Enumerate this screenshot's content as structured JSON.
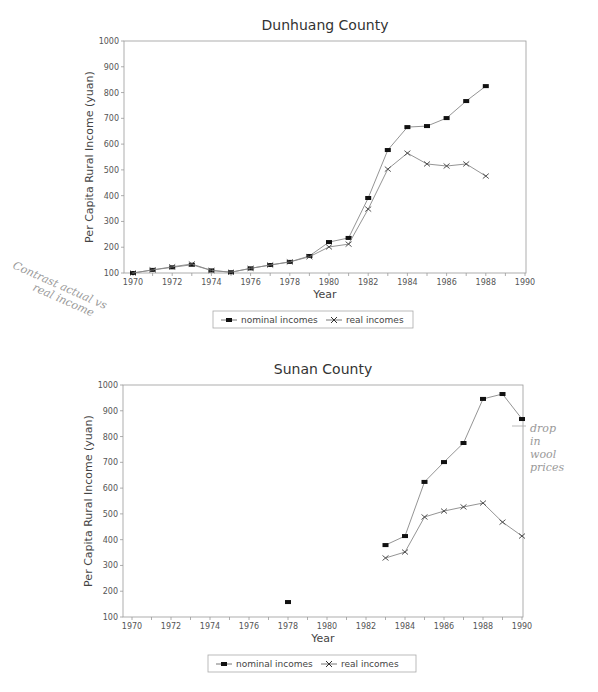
{
  "chart_data": [
    {
      "type": "line",
      "title": "Dunhuang County",
      "xlabel": "Year",
      "ylabel": "Per Capita Rural Income (yuan)",
      "xlim": [
        1970,
        1990
      ],
      "ylim": [
        100,
        1000
      ],
      "x_ticks": [
        "1970",
        "1972",
        "1974",
        "1976",
        "1978",
        "1980",
        "1982",
        "1984",
        "1986",
        "1988",
        "1990"
      ],
      "y_ticks": [
        "100",
        "200",
        "300",
        "400",
        "500",
        "600",
        "700",
        "800",
        "900",
        "1000"
      ],
      "grid": false,
      "legend_position": "bottom",
      "x": [
        1970,
        1971,
        1972,
        1973,
        1974,
        1975,
        1976,
        1977,
        1978,
        1979,
        1980,
        1981,
        1982,
        1983,
        1984,
        1985,
        1986,
        1987,
        1988
      ],
      "series": [
        {
          "name": "nominal incomes",
          "marker": "square",
          "values": [
            100,
            112,
            122,
            132,
            110,
            103,
            118,
            131,
            143,
            166,
            220,
            236,
            391,
            577,
            666,
            670,
            701,
            767,
            825
          ]
        },
        {
          "name": "real incomes",
          "marker": "x",
          "values": [
            100,
            112,
            124,
            135,
            110,
            103,
            118,
            131,
            143,
            163,
            201,
            212,
            348,
            503,
            565,
            523,
            515,
            523,
            476
          ]
        }
      ]
    },
    {
      "type": "line",
      "title": "Sunan County",
      "xlabel": "Year",
      "ylabel": "Per Capita Rural Income (yuan)",
      "xlim": [
        1970,
        1990
      ],
      "ylim": [
        100,
        1000
      ],
      "x_ticks": [
        "1970",
        "1972",
        "1974",
        "1976",
        "1978",
        "1980",
        "1982",
        "1984",
        "1986",
        "1988",
        "1990"
      ],
      "y_ticks": [
        "100",
        "200",
        "300",
        "400",
        "500",
        "600",
        "700",
        "800",
        "900",
        "1000"
      ],
      "grid": false,
      "legend_position": "bottom",
      "x": [
        1978,
        1983,
        1984,
        1985,
        1986,
        1987,
        1988,
        1989,
        1990
      ],
      "series": [
        {
          "name": "nominal incomes",
          "marker": "square",
          "values": [
            158,
            379,
            414,
            624,
            701,
            775,
            946,
            965,
            868
          ],
          "segments": [
            [
              1978
            ],
            [
              1983,
              1984,
              1985,
              1986,
              1987,
              1988,
              1989,
              1990
            ]
          ]
        },
        {
          "name": "real incomes",
          "marker": "x",
          "values": [
            null,
            329,
            352,
            488,
            511,
            527,
            542,
            468,
            414
          ]
        }
      ]
    }
  ],
  "annotations": {
    "dunhuang_note": [
      "Contrast actual vs",
      "real income"
    ],
    "sunan_note": [
      "drop",
      "in",
      "wool",
      "prices"
    ]
  },
  "legend": {
    "nominal": "nominal incomes",
    "real": "real incomes"
  }
}
